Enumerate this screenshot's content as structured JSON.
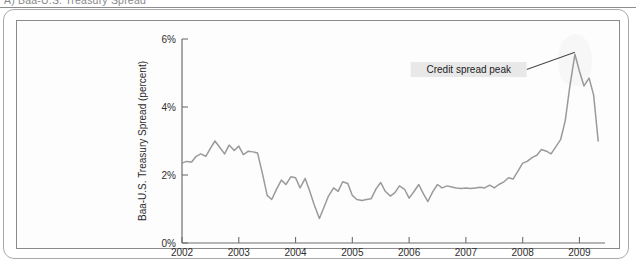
{
  "scan": {
    "top_caption": "A) Baa-U.S. Treasury Spread",
    "watermark_name": "paper-watermark"
  },
  "chart_data": {
    "type": "line",
    "title": "",
    "subtitle": "",
    "xlabel": "",
    "ylabel": "Baa-U.S. Treasury Spread (percent)",
    "xlim": [
      2002.0,
      2009.45
    ],
    "ylim": [
      0,
      6
    ],
    "grid": false,
    "legend": null,
    "y_ticks": [
      0,
      2,
      4,
      6
    ],
    "y_tick_labels": [
      "0%",
      "2%",
      "4%",
      "6%"
    ],
    "x_ticks": [
      2002,
      2003,
      2004,
      2005,
      2006,
      2007,
      2008,
      2009
    ],
    "x_tick_labels": [
      "2002",
      "2003",
      "2004",
      "2005",
      "2006",
      "2007",
      "2008",
      "2009"
    ],
    "series": [
      {
        "name": "Baa-U.S. Treasury Spread",
        "color": "#9a9a9a",
        "x": [
          2002.0,
          2002.08,
          2002.17,
          2002.25,
          2002.33,
          2002.42,
          2002.5,
          2002.58,
          2002.67,
          2002.75,
          2002.83,
          2002.92,
          2003.0,
          2003.08,
          2003.17,
          2003.25,
          2003.33,
          2003.42,
          2003.5,
          2003.58,
          2003.67,
          2003.75,
          2003.83,
          2003.92,
          2004.0,
          2004.08,
          2004.17,
          2004.25,
          2004.33,
          2004.42,
          2004.5,
          2004.58,
          2004.67,
          2004.75,
          2004.83,
          2004.92,
          2005.0,
          2005.08,
          2005.17,
          2005.25,
          2005.33,
          2005.42,
          2005.5,
          2005.58,
          2005.67,
          2005.75,
          2005.83,
          2005.92,
          2006.0,
          2006.08,
          2006.17,
          2006.25,
          2006.33,
          2006.42,
          2006.5,
          2006.58,
          2006.67,
          2006.75,
          2006.83,
          2006.92,
          2007.0,
          2007.08,
          2007.17,
          2007.25,
          2007.33,
          2007.42,
          2007.5,
          2007.58,
          2007.67,
          2007.75,
          2007.83,
          2007.92,
          2008.0,
          2008.08,
          2008.17,
          2008.25,
          2008.33,
          2008.42,
          2008.5,
          2008.58,
          2008.67,
          2008.75,
          2008.83,
          2008.92,
          2009.0,
          2009.08,
          2009.17,
          2009.25,
          2009.33
        ],
        "y": [
          2.35,
          2.4,
          2.38,
          2.55,
          2.62,
          2.55,
          2.78,
          3.0,
          2.8,
          2.62,
          2.88,
          2.72,
          2.85,
          2.6,
          2.7,
          2.68,
          2.65,
          2.02,
          1.4,
          1.28,
          1.6,
          1.85,
          1.72,
          1.95,
          1.92,
          1.62,
          1.9,
          1.52,
          1.12,
          0.72,
          1.05,
          1.38,
          1.62,
          1.52,
          1.8,
          1.75,
          1.4,
          1.28,
          1.25,
          1.28,
          1.3,
          1.6,
          1.78,
          1.52,
          1.38,
          1.48,
          1.68,
          1.58,
          1.32,
          1.5,
          1.72,
          1.45,
          1.22,
          1.52,
          1.72,
          1.62,
          1.68,
          1.65,
          1.62,
          1.6,
          1.62,
          1.6,
          1.62,
          1.64,
          1.62,
          1.7,
          1.62,
          1.72,
          1.8,
          1.92,
          1.88,
          2.12,
          2.35,
          2.4,
          2.52,
          2.58,
          2.75,
          2.7,
          2.62,
          2.82,
          3.05,
          3.6,
          4.6,
          5.55,
          5.05,
          4.62,
          4.85,
          4.35,
          3.0
        ]
      }
    ],
    "annotations": [
      {
        "label": "Credit spread peak",
        "target_x": 2008.92,
        "target_y": 5.55,
        "box_x": 2007.05,
        "box_y": 5.1
      }
    ]
  }
}
